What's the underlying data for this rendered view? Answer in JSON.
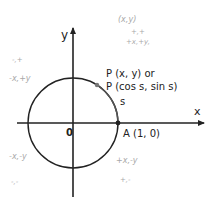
{
  "diagram": {
    "axes": {
      "x_label": "x",
      "y_label": "y",
      "origin_label": "0"
    },
    "points": {
      "A": {
        "label": "A (1, 0)"
      },
      "P": {
        "label_line1": "P (x, y) or",
        "label_line2": "P (cos s, sin s)"
      }
    },
    "arc_label": "s",
    "annotations": {
      "top_right_1": "(x,y)",
      "top_right_2": "+,+",
      "top_right_3": "+x,+y,",
      "top_left_1": "-,+",
      "top_left_2": "-x,+y",
      "bottom_left_1": "-x,-y",
      "bottom_left_2": "-,-",
      "bottom_right_1": "+x,-y",
      "bottom_right_2": "+,-"
    },
    "colors": {
      "ink": "#222222",
      "pencil": "#a8a8a8",
      "point_p": "#777777"
    }
  }
}
